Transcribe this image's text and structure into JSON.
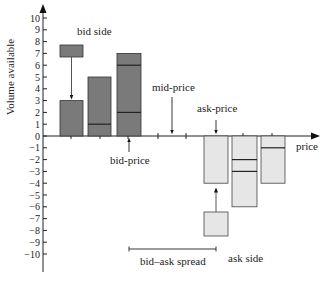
{
  "chart_data": {
    "type": "bar",
    "title": "",
    "xlabel": "price",
    "ylabel": "Volume available",
    "ylim": [
      -10,
      10
    ],
    "yticks": [
      10,
      9,
      8,
      7,
      6,
      5,
      4,
      3,
      2,
      1,
      0,
      -1,
      -2,
      -3,
      -4,
      -5,
      -6,
      -7,
      -8,
      -9,
      -10
    ],
    "grid": false,
    "bid_side": {
      "label": "bid side",
      "color": "#7a7a7a",
      "bars": [
        {
          "position": 1,
          "volume": 3,
          "dividers": []
        },
        {
          "position": 2,
          "volume": 5,
          "dividers": [
            1
          ]
        },
        {
          "position": 3,
          "volume": 7,
          "dividers": [
            2,
            6
          ]
        }
      ],
      "incoming_order": {
        "from": [
          6.7,
          7.7
        ],
        "target_bar": 1
      }
    },
    "ask_side": {
      "label": "ask side",
      "color": "#e6e6e6",
      "bars": [
        {
          "position": 6,
          "volume": -4,
          "dividers": []
        },
        {
          "position": 7,
          "volume": -6,
          "dividers": [
            -2,
            -3
          ]
        },
        {
          "position": 8,
          "volume": -4,
          "dividers": [
            -1
          ]
        }
      ],
      "incoming_order": {
        "from": [
          -6.4,
          -8.4
        ],
        "target_bar": 6
      }
    },
    "annotations": [
      {
        "text": "bid-price",
        "at_position": 3
      },
      {
        "text": "mid-price",
        "at_position": 4.5
      },
      {
        "text": "ask-price",
        "at_position": 6
      },
      {
        "text": "bid–ask spread",
        "from_position": 3,
        "to_position": 6
      }
    ]
  },
  "labels": {
    "y_axis": "Volume available",
    "x_axis": "price",
    "bid_side": "bid side",
    "ask_side": "ask side",
    "bid_price": "bid-price",
    "mid_price": "mid-price",
    "ask_price": "ask-price",
    "spread": "bid–ask spread"
  },
  "tick_labels": [
    "10",
    "9",
    "8",
    "7",
    "6",
    "5",
    "4",
    "3",
    "2",
    "1",
    "0",
    "-1",
    "-2",
    "-3",
    "-4",
    "-5",
    "-6",
    "-7",
    "-8",
    "-9",
    "-10"
  ]
}
